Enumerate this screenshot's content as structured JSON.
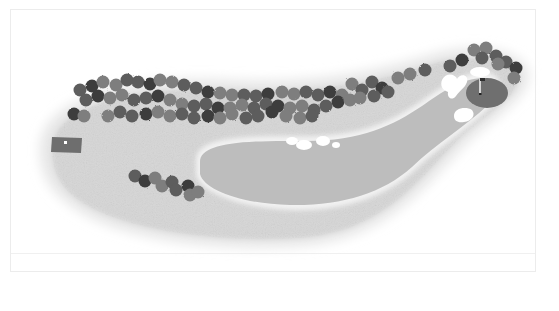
{
  "diagram": {
    "type": "golf-hole-layout",
    "colors": {
      "background": "#ffffff",
      "rough": "#d9d9d9",
      "rough_edge": "#ececec",
      "fairway": "#b9b9b9",
      "green": "#6f6f6f",
      "tee_box": "#6e6e6e",
      "bunker": "#ffffff",
      "tree_dark": "#3e3e3e",
      "tree_mid": "#5d5d5d",
      "tree_light": "#7e7e7e",
      "flag_pole": "#ffffff",
      "flag": "#2e2e2e",
      "frame_border": "#ececec"
    },
    "elements": {
      "tee_box": {
        "label": "Tee box",
        "x": 52,
        "y": 137,
        "w": 30,
        "h": 17
      },
      "green": {
        "label": "Green",
        "cx": 487,
        "cy": 93,
        "rx": 21,
        "ry": 16
      },
      "pin": {
        "label": "Pin / flag",
        "x": 482,
        "y": 78
      },
      "bunkers": [
        {
          "label": "Bunker",
          "cx": 455,
          "cy": 83
        },
        {
          "label": "Bunker",
          "cx": 480,
          "cy": 72
        },
        {
          "label": "Bunker",
          "cx": 464,
          "cy": 114
        },
        {
          "label": "Bunker",
          "cx": 291,
          "cy": 140
        },
        {
          "label": "Bunker",
          "cx": 305,
          "cy": 144
        },
        {
          "label": "Bunker",
          "cx": 324,
          "cy": 140
        },
        {
          "label": "Bunker",
          "cx": 337,
          "cy": 144
        }
      ],
      "tree_lines": [
        {
          "label": "Left tree line",
          "from": [
            72,
            75
          ],
          "to": [
            430,
            70
          ]
        },
        {
          "label": "Green-side trees",
          "from": [
            445,
            50
          ],
          "to": [
            522,
            80
          ]
        },
        {
          "label": "Right-of-tee tree cluster",
          "from": [
            135,
            175
          ],
          "to": [
            195,
            200
          ]
        }
      ]
    }
  }
}
